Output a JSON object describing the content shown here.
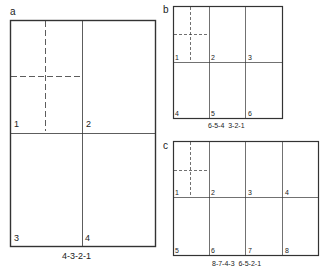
{
  "figures": {
    "a": {
      "letter": "a",
      "panels": [
        "1",
        "2",
        "3",
        "4"
      ],
      "caption": "4-3-2-1"
    },
    "b": {
      "letter": "b",
      "panels": [
        "1",
        "2",
        "3",
        "4",
        "5",
        "6"
      ],
      "caption": "6-5-4  3-2-1"
    },
    "c": {
      "letter": "c",
      "panels": [
        "1",
        "2",
        "3",
        "4",
        "5",
        "6",
        "7",
        "8"
      ],
      "caption": "8-7-4-3  6-5-2-1"
    }
  },
  "colors": {
    "line": "#333333",
    "background": "#ffffff"
  }
}
